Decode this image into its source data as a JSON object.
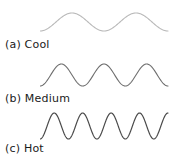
{
  "figure": {
    "title": "",
    "background_color": "#ffffff",
    "width": 175,
    "height": 160
  },
  "chart_data": {
    "type": "line",
    "title": "",
    "xlabel": "",
    "ylabel": "",
    "grid": false,
    "legend_position": "none",
    "series": [
      {
        "name": "Cool",
        "label": "(a) Cool",
        "cycles": 2.0,
        "amplitude": 9,
        "wavelength": 62,
        "stroke_color": "#b9b9b9",
        "stroke_width": 1.1,
        "x_start": 0,
        "x_end": 128,
        "baseline_y": 19
      },
      {
        "name": "Medium",
        "label": "(b) Medium",
        "cycles": 3.0,
        "amplitude": 11,
        "wavelength": 42,
        "stroke_color": "#6e6e6e",
        "stroke_width": 1.1,
        "x_start": 0,
        "x_end": 128,
        "baseline_y": 17
      },
      {
        "name": "Hot",
        "label": "(c) Hot",
        "cycles": 4.5,
        "amplitude": 13,
        "wavelength": 28,
        "stroke_color": "#4a4a4a",
        "stroke_width": 1.2,
        "x_start": 0,
        "x_end": 128,
        "baseline_y": 18
      }
    ]
  },
  "captions": {
    "cool": "(a) Cool",
    "medium": "(b) Medium",
    "hot": "(c) Hot"
  }
}
